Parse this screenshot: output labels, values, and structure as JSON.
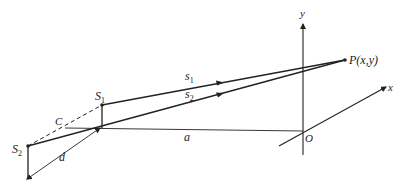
{
  "diagram": {
    "labels": {
      "S1": "S",
      "S1_sub": "1",
      "S2": "S",
      "S2_sub": "2",
      "C": "C",
      "d": "d",
      "a": "a",
      "s1": "s",
      "s1_sub": "1",
      "s2": "s",
      "s2_sub": "2",
      "P": "P(x,y)",
      "O": "O",
      "x_axis": "x",
      "y_axis": "y"
    },
    "colors": {
      "line": "#222222",
      "background": "#ffffff"
    }
  }
}
